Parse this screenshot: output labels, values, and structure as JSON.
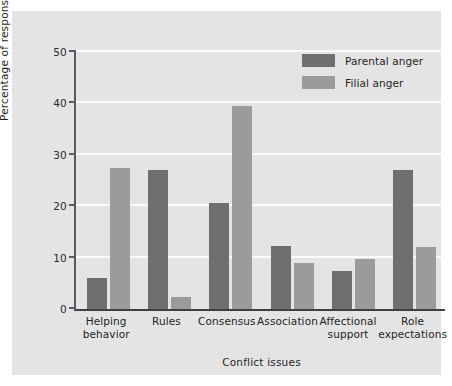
{
  "chart_data": {
    "type": "bar",
    "title": "",
    "xlabel": "Conflict issues",
    "ylabel": "Percentage of responses",
    "ylim": [
      0,
      50
    ],
    "yticks": [
      0,
      10,
      20,
      30,
      40,
      50
    ],
    "grid": "horizontal",
    "legend_position": "top-right",
    "categories": [
      "Helping behavior",
      "Rules",
      "Consensus",
      "Association",
      "Affectional support",
      "Role expectations"
    ],
    "category_lines": [
      [
        "Helping",
        "behavior"
      ],
      [
        "Rules",
        ""
      ],
      [
        "Consensus",
        ""
      ],
      [
        "Association",
        ""
      ],
      [
        "Affectional",
        "support"
      ],
      [
        "Role",
        "expectations"
      ]
    ],
    "series": [
      {
        "name": "Parental anger",
        "color": "#6f6f6f",
        "values": [
          6.1,
          27.0,
          20.6,
          12.3,
          7.3,
          27.0
        ]
      },
      {
        "name": "Filial anger",
        "color": "#9b9b9b",
        "values": [
          27.5,
          2.3,
          39.5,
          8.9,
          9.7,
          12.0
        ]
      }
    ]
  },
  "figure": {
    "background_color": "#e4e4e4",
    "gridline_color": "#fafafa",
    "axis_color": "#3e3e46"
  }
}
